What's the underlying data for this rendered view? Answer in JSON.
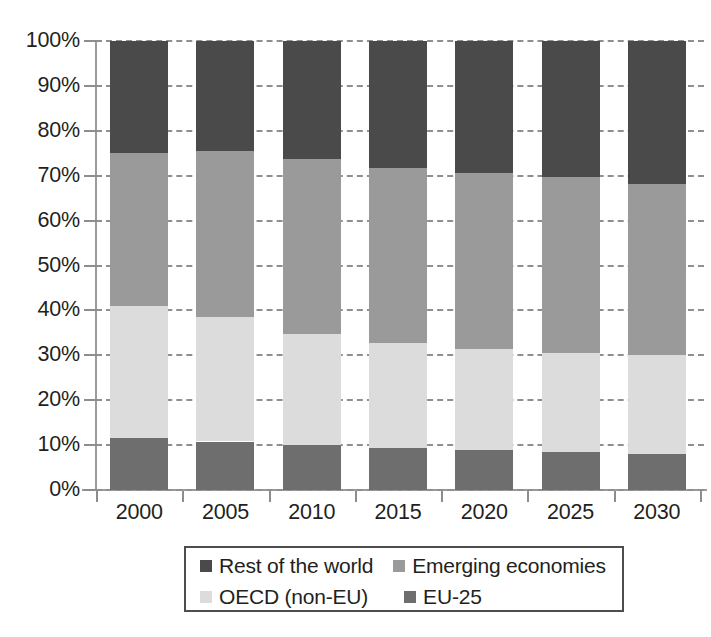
{
  "chart_data": {
    "type": "bar",
    "stacked": true,
    "normalized": true,
    "title": "",
    "subtitle": "",
    "xlabel": "",
    "ylabel": "",
    "categories": [
      "2000",
      "2005",
      "2010",
      "2015",
      "2020",
      "2025",
      "2030"
    ],
    "ylim": [
      0,
      100
    ],
    "yticks": [
      0,
      10,
      20,
      30,
      40,
      50,
      60,
      70,
      80,
      90,
      100
    ],
    "ytick_labels": [
      "0%",
      "10%",
      "20%",
      "30%",
      "40%",
      "50%",
      "60%",
      "70%",
      "80%",
      "90%",
      "100%"
    ],
    "grid": true,
    "grid_axis": "y",
    "grid_style": "dashed",
    "legend_position": "bottom",
    "stack_order_bottom_to_top": [
      "EU-25",
      "OECD (non-EU)",
      "Emerging economies",
      "Rest of the world"
    ],
    "series": [
      {
        "name": "Rest of the world",
        "color": "#4a4a4a",
        "values": [
          25.0,
          24.5,
          26.2,
          28.2,
          29.5,
          30.4,
          31.8
        ]
      },
      {
        "name": "Emerging economies",
        "color": "#9a9a9a",
        "values": [
          34.0,
          37.0,
          39.0,
          39.1,
          39.2,
          39.0,
          38.2
        ]
      },
      {
        "name": "OECD (non-EU)",
        "color": "#dcdcdc",
        "values": [
          29.5,
          27.7,
          24.8,
          23.3,
          22.4,
          22.2,
          22.0
        ]
      },
      {
        "name": "EU-25",
        "color": "#6e6e6e",
        "values": [
          11.5,
          10.8,
          10.0,
          9.4,
          8.9,
          8.4,
          8.0
        ]
      }
    ],
    "cumulative_tops": {
      "EU-25": [
        11.5,
        10.8,
        10.0,
        9.4,
        8.9,
        8.4,
        8.0
      ],
      "OECD (non-EU)": [
        41.0,
        38.5,
        34.8,
        32.7,
        31.3,
        30.6,
        30.0
      ],
      "Emerging economies": [
        75.0,
        75.5,
        73.8,
        71.8,
        70.5,
        69.6,
        68.2
      ],
      "Rest of the world": [
        100.0,
        100.0,
        100.0,
        100.0,
        100.0,
        100.0,
        100.0
      ]
    }
  },
  "legend": {
    "items": [
      {
        "label": "Rest of the world",
        "color": "#4a4a4a"
      },
      {
        "label": "Emerging economies",
        "color": "#9a9a9a"
      },
      {
        "label": "OECD (non-EU)",
        "color": "#dcdcdc"
      },
      {
        "label": "EU-25",
        "color": "#6e6e6e"
      }
    ]
  },
  "axes": {
    "y_tick_labels": [
      "100%",
      "90%",
      "80%",
      "70%",
      "60%",
      "50%",
      "40%",
      "30%",
      "20%",
      "10%",
      "0%"
    ],
    "x_tick_labels": [
      "2000",
      "2005",
      "2010",
      "2015",
      "2020",
      "2025",
      "2030"
    ]
  }
}
